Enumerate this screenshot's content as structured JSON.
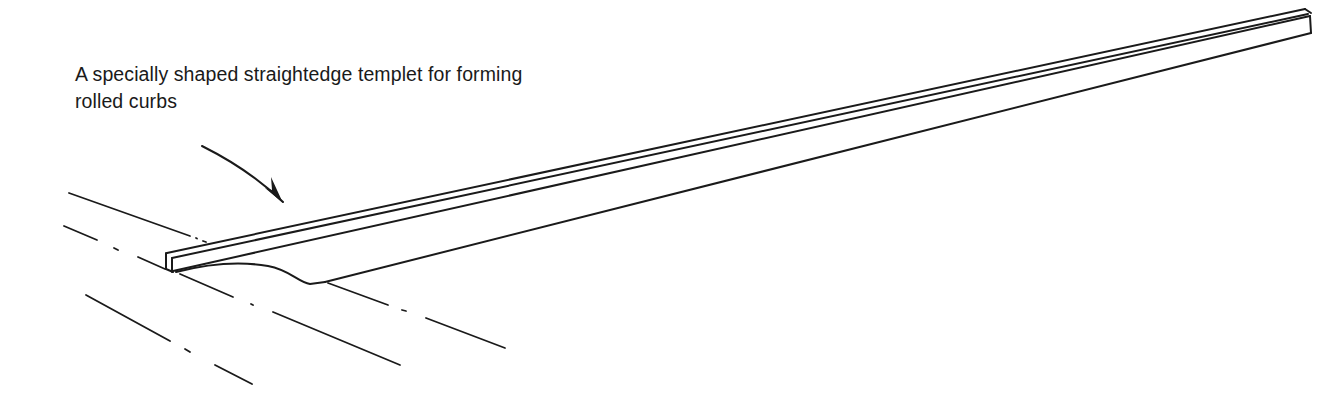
{
  "figure": {
    "caption_lines": [
      "A specially shaped straightedge templet for forming",
      "rolled curbs"
    ],
    "colors": {
      "ink": "#1a1a1a",
      "background": "#ffffff"
    }
  }
}
